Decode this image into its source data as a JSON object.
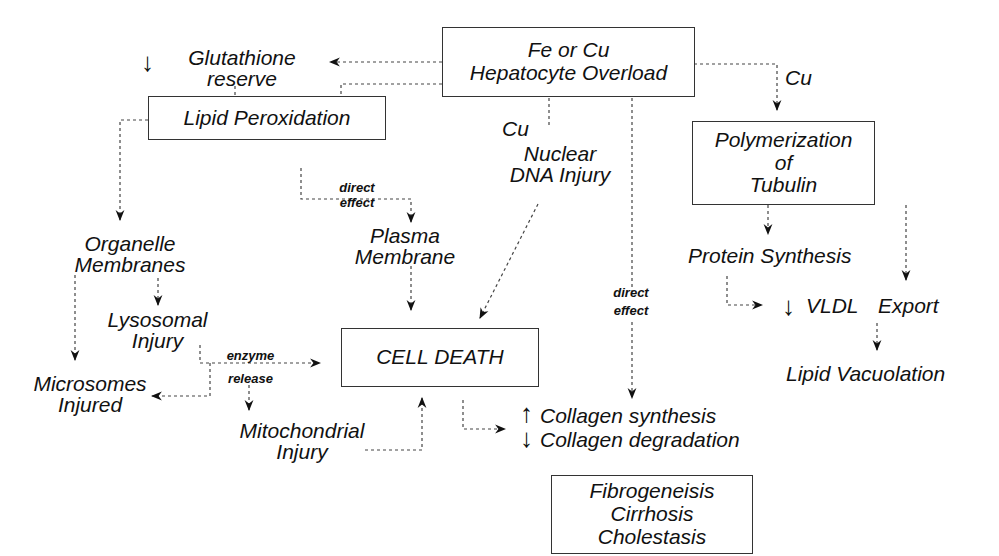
{
  "title_partial": "...) ... ... ... pp... ... ... p... ... y",
  "nodes": {
    "overload": {
      "lines": [
        "Fe or Cu",
        "Hepatocyte Overload"
      ]
    },
    "glutathione": {
      "prefix_icon": "down-arrow",
      "lines": [
        "Glutathione",
        "reserve"
      ]
    },
    "lipid_perox": {
      "lines": [
        "Lipid Peroxidation"
      ]
    },
    "cu_label_right": "Cu",
    "cu_label_mid": "Cu",
    "nuclear": {
      "lines": [
        "Nuclear",
        "DNA Injury"
      ]
    },
    "polymerization": {
      "lines": [
        "Polymerization",
        "of",
        "Tubulin"
      ]
    },
    "direct_effect_1": {
      "lines": [
        "direct",
        "effect"
      ]
    },
    "plasma": {
      "lines": [
        "Plasma",
        "Membrane"
      ]
    },
    "organelle": {
      "lines": [
        "Organelle",
        "Membranes"
      ]
    },
    "lysosomal": {
      "lines": [
        "Lysosomal",
        "Injury"
      ]
    },
    "microsomes": {
      "lines": [
        "Microsomes",
        "Injured"
      ]
    },
    "enzyme_release": {
      "lines": [
        "enzyme",
        "release"
      ]
    },
    "cell_death": {
      "lines": [
        "CELL DEATH"
      ]
    },
    "mitochondrial": {
      "lines": [
        "Mitochondrial",
        "Injury"
      ]
    },
    "direct_effect_2": {
      "lines": [
        "direct",
        "effect"
      ]
    },
    "protein_synthesis": {
      "lines": [
        "Protein Synthesis"
      ]
    },
    "vldl": {
      "prefix_icon": "down-arrow",
      "lines": [
        "VLDL Export"
      ]
    },
    "lipid_vacuolation": {
      "lines": [
        "Lipid Vacuolation"
      ]
    },
    "collagen": {
      "lines": [
        "Collagen synthesis",
        "Collagen degradation"
      ],
      "prefix_icons": [
        "up-arrow",
        "down-arrow"
      ]
    },
    "outcome": {
      "lines": [
        "Fibrogeneisis",
        "Cirrhosis",
        "Cholestasis"
      ]
    }
  }
}
